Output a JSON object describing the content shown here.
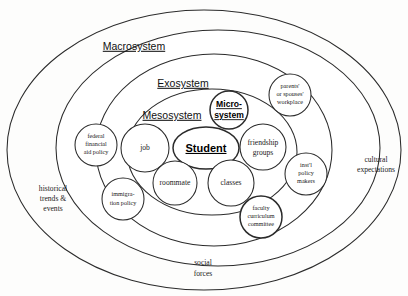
{
  "diagram": {
    "type": "nested-ellipse-diagram",
    "rings": [
      {
        "id": "macrosystem",
        "label": "Macrosystem"
      },
      {
        "id": "exosystem",
        "label": "Exosystem"
      },
      {
        "id": "mesosystem",
        "label": "Mesosystem"
      },
      {
        "id": "microsystem",
        "label_line1": "Micro-",
        "label_line2": "system"
      }
    ],
    "center": {
      "label": "Student"
    },
    "bubbles": {
      "federal_aid": {
        "line1": "federal",
        "line2": "financial",
        "line3": "aid policy"
      },
      "job": {
        "line1": "job"
      },
      "roommate": {
        "line1": "roommate"
      },
      "classes": {
        "line1": "classes"
      },
      "friendship": {
        "line1": "friendship",
        "line2": "groups"
      },
      "workplace": {
        "line1": "parents'",
        "line2": "or spouses'",
        "line3": "workplace"
      },
      "policy_makers": {
        "line1": "inst'l",
        "line2": "policy",
        "line3": "makers"
      },
      "immigration": {
        "line1": "immigra-",
        "line2": "tion policy"
      },
      "faculty": {
        "line1": "faculty",
        "line2": "curriculum",
        "line3": "committee"
      }
    },
    "outer_labels": {
      "cultural": {
        "line1": "cultural",
        "line2": "expectations"
      },
      "historical": {
        "line1": "historical",
        "line2": "trends &",
        "line3": "events"
      },
      "social": {
        "line1": "social",
        "line2": "forces"
      }
    },
    "colors": {
      "stroke": "#2b2b2b",
      "background": "#fdfdfc",
      "text": "#1a1a1a"
    }
  }
}
